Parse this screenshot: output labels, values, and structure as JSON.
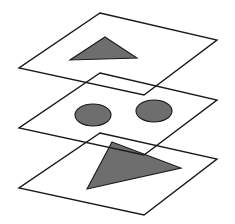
{
  "diagram": {
    "title": "",
    "colors": {
      "background": "#ffffff",
      "outline": "#1a1a1a",
      "fill_shape": "#6e6e6e"
    },
    "layers": [
      {
        "id": "top",
        "plane": [
          [
            100,
            13
          ],
          [
            217,
            40
          ],
          [
            144,
            95
          ],
          [
            19,
            68
          ]
        ],
        "shapes": [
          {
            "type": "triangle",
            "points": [
              [
                105,
                37
              ],
              [
                137,
                58
              ],
              [
                70,
                60
              ]
            ]
          }
        ]
      },
      {
        "id": "middle",
        "plane": [
          [
            100,
            73
          ],
          [
            217,
            100
          ],
          [
            144,
            155
          ],
          [
            19,
            128
          ]
        ],
        "shapes": [
          {
            "type": "ellipse",
            "cx": 93,
            "cy": 115,
            "rx": 18,
            "ry": 11
          },
          {
            "type": "ellipse",
            "cx": 154,
            "cy": 111,
            "rx": 18,
            "ry": 11
          }
        ]
      },
      {
        "id": "bottom",
        "plane": [
          [
            100,
            133
          ],
          [
            217,
            159
          ],
          [
            144,
            215
          ],
          [
            19,
            188
          ]
        ],
        "shapes": [
          {
            "type": "triangle",
            "points": [
              [
                112,
                142
              ],
              [
                181,
                168
              ],
              [
                87,
                189
              ]
            ]
          }
        ]
      }
    ]
  }
}
